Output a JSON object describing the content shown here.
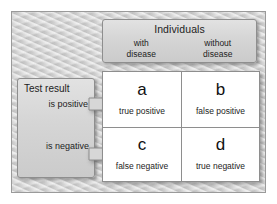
{
  "diagram": {
    "background_color": "#cfcfcf",
    "box_color": "#d5d5d5",
    "table_background": "#ffffff",
    "border_color": "#8e8e8e",
    "text_color": "#1d1d1d"
  },
  "header": {
    "title": "Individuals",
    "columns": [
      {
        "line1": "with",
        "line2": "disease"
      },
      {
        "line1": "without",
        "line2": "disease"
      }
    ]
  },
  "left_panel": {
    "title": "Test result",
    "rows": [
      {
        "label": "is positive",
        "arrow": "right-arrow-icon"
      },
      {
        "label": "is negative",
        "arrow": "right-arrow-icon"
      }
    ]
  },
  "matrix": {
    "cells": [
      {
        "letter": "a",
        "caption": "true positive"
      },
      {
        "letter": "b",
        "caption": "false positive"
      },
      {
        "letter": "c",
        "caption": "false negative"
      },
      {
        "letter": "d",
        "caption": "true negative"
      }
    ]
  }
}
